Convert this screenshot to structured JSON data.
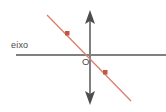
{
  "figure": {
    "width": 166,
    "height": 112,
    "background_color": "#ffffff"
  },
  "labels": {
    "horizontal_axis": "eixo",
    "origin": "O"
  },
  "colors": {
    "axis": "#808080",
    "axis_dark": "#6e6e6e",
    "line": "#d9806e",
    "marker": "#c4573f",
    "text": "#4a4a4a"
  },
  "geometry": {
    "horizontal_axis": {
      "x1": 16,
      "y1": 55,
      "x2": 166,
      "y2": 55,
      "stroke_width": 2
    },
    "vertical_axis": {
      "x1": 90,
      "y1": 14,
      "x2": 90,
      "y2": 101,
      "stroke_width": 2
    },
    "origin_point": {
      "x": 90,
      "y": 55
    },
    "arrowheads": [
      {
        "name": "vertical-axis-up-arrow",
        "direction": "up",
        "x": 90,
        "y": 12
      },
      {
        "name": "vertical-axis-down-arrow",
        "direction": "down",
        "x": 90,
        "y": 103
      }
    ],
    "red_line": {
      "x1": 47,
      "y1": 15,
      "x2": 131,
      "y2": 101,
      "stroke_width": 1.2
    },
    "markers": [
      {
        "name": "point-upper-left",
        "x": 67,
        "y": 33,
        "size": 4
      },
      {
        "name": "point-lower-right",
        "x": 105,
        "y": 72,
        "size": 4
      }
    ]
  }
}
